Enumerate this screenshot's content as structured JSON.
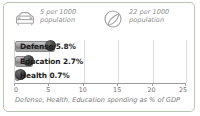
{
  "card": {
    "border_color": "#b9c7b0",
    "background": "#ffffff"
  },
  "stats": [
    {
      "icon": "car-icon",
      "value_line1": "5 per 1000",
      "value_line2": "population"
    },
    {
      "icon": "telephone-dial-icon",
      "value_line1": "22 per 1000",
      "value_line2": "population"
    }
  ],
  "chart_data": {
    "type": "bar",
    "orientation": "horizontal",
    "title": "",
    "categories": [
      "Defense",
      "Education",
      "Health"
    ],
    "values": [
      5.8,
      2.7,
      0.7
    ],
    "labels": [
      "Defense 5.8%",
      "Education 2.7%",
      "Health 0.7%"
    ],
    "xlabel": "Defense, Health, Education spending as % of GDP",
    "ylabel": "",
    "xlim": [
      0,
      25
    ],
    "xticks": [
      0,
      5,
      10,
      15,
      20,
      25
    ],
    "xticklabels": [
      "0",
      "5",
      "10",
      "15",
      "20",
      "25"
    ],
    "grid": true,
    "legend": false,
    "bar_color": "#9e9e9e"
  },
  "caption": "Defense, Health, Education spending as % of GDP"
}
